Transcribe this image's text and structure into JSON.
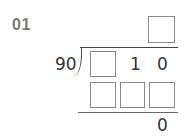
{
  "problem": {
    "number": "01",
    "divisor": "90",
    "quotient_boxes": 1,
    "dividend": {
      "box_count": 1,
      "digits": [
        "1",
        "0"
      ]
    },
    "subtraction_boxes": 3,
    "remainder": "0"
  }
}
